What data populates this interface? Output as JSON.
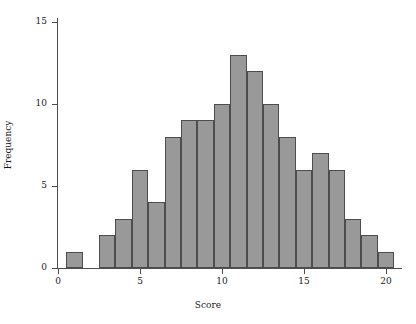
{
  "chart_data": {
    "type": "bar",
    "title": "",
    "subtitle": "",
    "xlabel": "Score",
    "ylabel": "Frequency",
    "grid": false,
    "legend": null,
    "xlim": [
      0,
      21
    ],
    "ylim": [
      0,
      16
    ],
    "xticks": [
      0,
      5,
      10,
      15,
      20
    ],
    "yticks": [
      0,
      5,
      10,
      15
    ],
    "bin_width": 1,
    "categories": [
      1,
      2,
      3,
      4,
      5,
      6,
      7,
      8,
      9,
      10,
      11,
      12,
      13,
      14,
      15,
      16,
      17,
      18,
      19,
      20
    ],
    "values": [
      1,
      0,
      2,
      3,
      6,
      4,
      8,
      9,
      9,
      10,
      13,
      12,
      10,
      8,
      6,
      7,
      6,
      3,
      2,
      1
    ],
    "bars": [
      {
        "center": 1,
        "value": 1
      },
      {
        "center": 2,
        "value": 0
      },
      {
        "center": 3,
        "value": 2
      },
      {
        "center": 4,
        "value": 3
      },
      {
        "center": 5,
        "value": 6
      },
      {
        "center": 6,
        "value": 4
      },
      {
        "center": 7,
        "value": 8
      },
      {
        "center": 8,
        "value": 9
      },
      {
        "center": 9,
        "value": 9
      },
      {
        "center": 10,
        "value": 10
      },
      {
        "center": 11,
        "value": 13
      },
      {
        "center": 12,
        "value": 12
      },
      {
        "center": 13,
        "value": 10
      },
      {
        "center": 14,
        "value": 8
      },
      {
        "center": 15,
        "value": 6
      },
      {
        "center": 16,
        "value": 7
      },
      {
        "center": 17,
        "value": 6
      },
      {
        "center": 18,
        "value": 3
      },
      {
        "center": 19,
        "value": 2
      },
      {
        "center": 20,
        "value": 1
      }
    ],
    "colors": {
      "bar_fill": "#999999",
      "bar_edge": "#4d4d4d",
      "axis": "#4d4d4d",
      "text": "#1a1a1a",
      "background": "#ffffff"
    }
  }
}
